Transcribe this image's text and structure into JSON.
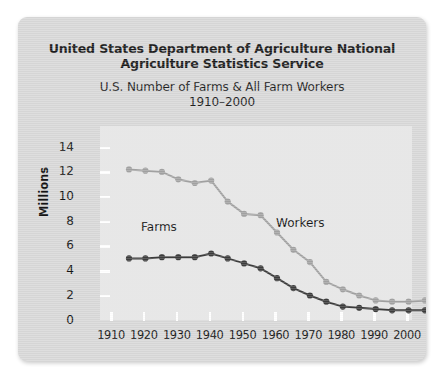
{
  "card": {
    "title_line1": "United States Department of Agriculture National",
    "title_line2": "Agriculture Statistics Service",
    "subtitle_line1": "U.S. Number of Farms & All Farm Workers",
    "subtitle_line2": "1910–2000"
  },
  "chart_data": {
    "type": "line",
    "title": "U.S. Number of Farms & All Farm Workers 1910–2000",
    "xlabel": "",
    "ylabel": "Millions",
    "xlim": [
      1910,
      2000
    ],
    "ylim": [
      0,
      15
    ],
    "yticks": [
      0,
      2,
      4,
      6,
      8,
      10,
      12,
      14
    ],
    "xticks": [
      1910,
      1920,
      1930,
      1940,
      1950,
      1960,
      1970,
      1980,
      1990,
      2000
    ],
    "grid": false,
    "legend_position": "inline-labels",
    "x": [
      1910,
      1915,
      1920,
      1925,
      1930,
      1935,
      1940,
      1945,
      1950,
      1955,
      1960,
      1965,
      1970,
      1975,
      1980,
      1985,
      1990,
      1995,
      2000
    ],
    "series": [
      {
        "name": "Workers",
        "color": "#a3a3a3",
        "values": [
          13.6,
          13.5,
          13.4,
          12.8,
          12.5,
          12.7,
          11.0,
          10.0,
          9.9,
          8.5,
          7.1,
          6.1,
          4.5,
          3.9,
          3.4,
          3.0,
          2.9,
          2.9,
          3.0
        ]
      },
      {
        "name": "Farms",
        "color": "#3d3d3d",
        "values": [
          6.4,
          6.4,
          6.5,
          6.5,
          6.5,
          6.8,
          6.4,
          6.0,
          5.6,
          4.8,
          4.0,
          3.4,
          2.9,
          2.5,
          2.4,
          2.3,
          2.2,
          2.2,
          2.2
        ]
      }
    ]
  },
  "axis_labels": {
    "y": [
      "14",
      "12",
      "10",
      "8",
      "6",
      "4",
      "2",
      "0"
    ],
    "x": [
      "1910",
      "1920",
      "1930",
      "1940",
      "1950",
      "1960",
      "1970",
      "1980",
      "1990",
      "2000"
    ]
  },
  "series_labels": {
    "farms": "Farms",
    "workers": "Workers"
  }
}
